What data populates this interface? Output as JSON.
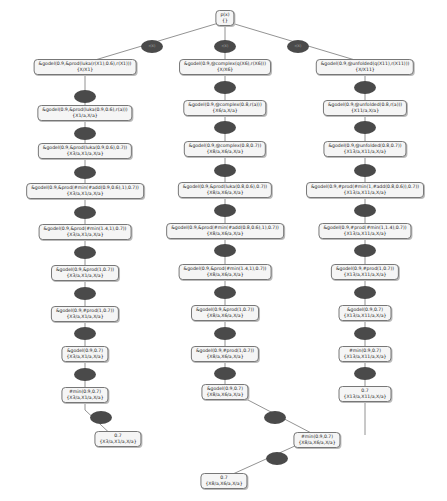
{
  "root": {
    "line1": "p(x)",
    "line2": "{}"
  },
  "edge_label": "r(X)",
  "left": [
    {
      "l1": "&godel(0.9,&prod(luka(r(X1),0.6),r(X1)))",
      "l2": "{X/X1}"
    },
    {
      "l1": "&godel(0.9,&prod(luka(0.9,0.6),r(a)))",
      "l2": "{X1/a,X/a}"
    },
    {
      "l1": "&godel(0.9,&prod(luka(0.9,0.6),0.7))",
      "l2": "{X3/a,X1/a,X/a}"
    },
    {
      "l1": "&godel(0.9,&prod(#min(#add(0.9,0.6),1),0.7))",
      "l2": "{X3/a,X1/a,X/a}"
    },
    {
      "l1": "&godel(0.9,&prod(#min(1.4,1),0.7))",
      "l2": "{X3/a,X1/a,X/a}"
    },
    {
      "l1": "&godel(0.9,&prod(1,0.7))",
      "l2": "{X3/a,X1/a,X/a}"
    },
    {
      "l1": "&godel(0.9,#prod(1,0.7))",
      "l2": "{X3/a,X1/a,X/a}"
    },
    {
      "l1": "&godel(0.9,0.7)",
      "l2": "{X3/a,X1/a,X/a}"
    },
    {
      "l1": "#min(0.9,0.7)",
      "l2": "{X3/a,X1/a,X/a}"
    },
    {
      "l1": "0.7",
      "l2": "{X3/a,X1/a,X/a}"
    }
  ],
  "middle": [
    {
      "l1": "&godel(0.9,@complex(q(X6),r(X6)))",
      "l2": "{X/X6}"
    },
    {
      "l1": "&godel(0.9,@complex(0.8,r(a)))",
      "l2": "{X6/a,X/a}"
    },
    {
      "l1": "&godel(0.9,@complex(0.8,0.7))",
      "l2": "{X8/a,X6/a,X/a}"
    },
    {
      "l1": "&godel(0.9,&prod(luka(0.8,0.6),0.7))",
      "l2": "{X8/a,X6/a,X/a}"
    },
    {
      "l1": "&godel(0.9,&prod(#min(#add(0.8,0.6),1),0.7))",
      "l2": "{X8/a,X6/a,X/a}"
    },
    {
      "l1": "&godel(0.9,&prod(#min(1.4,1),0.7))",
      "l2": "{X8/a,X6/a,X/a}"
    },
    {
      "l1": "&godel(0.9,&prod(1,0.7))",
      "l2": "{X8/a,X6/a,X/a}"
    },
    {
      "l1": "&godel(0.9,#prod(1,0.7))",
      "l2": "{X8/a,X6/a,X/a}"
    },
    {
      "l1": "&godel(0.9,0.7)",
      "l2": "{X8/a,X6/a,X/a}"
    },
    {
      "l1": "#min(0.9,0.7)",
      "l2": "{X8/a,X6/a,X/a}"
    },
    {
      "l1": "0.7",
      "l2": "{X8/a,X6/a,X/a}"
    }
  ],
  "right": [
    {
      "l1": "&godel(0.9,@unfolded(q(X11),r(X11)))",
      "l2": "{X/X11}"
    },
    {
      "l1": "&godel(0.9,@unfolded(0.8,r(a)))",
      "l2": "{X11/a,X/a}"
    },
    {
      "l1": "&godel(0.9,@unfolded(0.8,0.7))",
      "l2": "{X13/a,X11/a,X/a}"
    },
    {
      "l1": "&godel(0.9,#prod(#min(1,#add(0.8,0.6)),0.7))",
      "l2": "{X13/a,X11/a,X/a}"
    },
    {
      "l1": "&godel(0.9,#prod(#min(1,1.4),0.7))",
      "l2": "{X13/a,X11/a,X/a}"
    },
    {
      "l1": "&godel(0.9,#prod(1,0.7))",
      "l2": "{X13/a,X11/a,X/a}"
    },
    {
      "l1": "&godel(0.9,0.7)",
      "l2": "{X13/a,X11/a,X/a}"
    },
    {
      "l1": "#min(0.9,0.7)",
      "l2": "{X13/a,X11/a,X/a}"
    },
    {
      "l1": "0.7",
      "l2": "{X13/a,X11/a,X/a}"
    }
  ]
}
